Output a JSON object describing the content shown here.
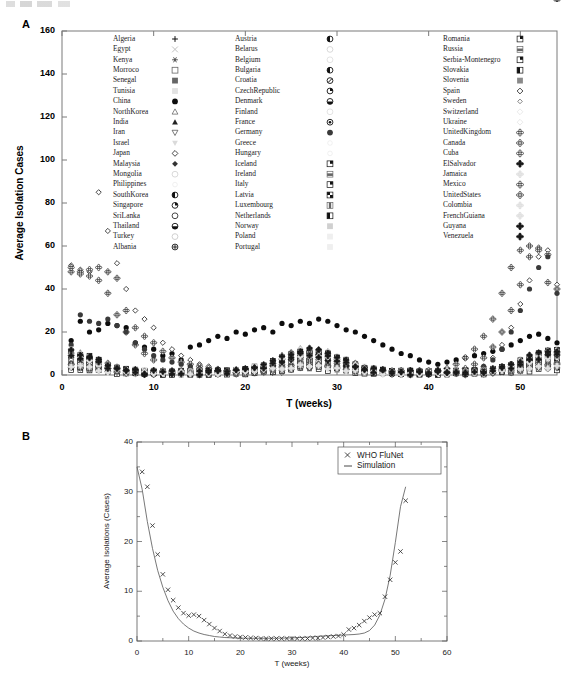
{
  "figure": {
    "panel_a_label": "A",
    "panel_b_label": "B"
  },
  "panel_a": {
    "ylabel": "Average Isolation Cases",
    "xlabel": "T (weeks)",
    "yticks": [
      "0",
      "20",
      "40",
      "60",
      "80",
      "100",
      "120",
      "140",
      "160"
    ],
    "xticks": [
      "0",
      "10",
      "20",
      "30",
      "40",
      "50"
    ],
    "ylim": [
      0,
      160
    ],
    "xlim": [
      0,
      54
    ],
    "legend_col1": [
      {
        "label": "Algeria",
        "marker": "plus"
      },
      {
        "label": "Egypt",
        "marker": "cross"
      },
      {
        "label": "Kenya",
        "marker": "asterisk"
      },
      {
        "label": "Morroco",
        "marker": "square-open"
      },
      {
        "label": "Senegal",
        "marker": "square-filled"
      },
      {
        "label": "Tunisia",
        "marker": "square-faint"
      },
      {
        "label": "China",
        "marker": "circle-filled"
      },
      {
        "label": "NorthKorea",
        "marker": "triangle-open"
      },
      {
        "label": "India",
        "marker": "triangle-filled"
      },
      {
        "label": "Iran",
        "marker": "invtriangle-open"
      },
      {
        "label": "Israel",
        "marker": "invtriangle-faint"
      },
      {
        "label": "Japan",
        "marker": "diamond-open"
      },
      {
        "label": "Malaysia",
        "marker": "diamond-filled"
      },
      {
        "label": "Mongolia",
        "marker": "circle-faint"
      },
      {
        "label": "Philippines",
        "marker": "dot-faint"
      },
      {
        "label": "SouthKorea",
        "marker": "circle-half-left"
      },
      {
        "label": "Singapore",
        "marker": "circle-quarter"
      },
      {
        "label": "SriLanka",
        "marker": "circle-open2"
      },
      {
        "label": "Thailand",
        "marker": "circle-half-bottom"
      },
      {
        "label": "Turkey",
        "marker": "circle-light"
      },
      {
        "label": "Albania",
        "marker": "circle-cross"
      }
    ],
    "legend_col2": [
      {
        "label": "Austria",
        "marker": "circle-half-left"
      },
      {
        "label": "Belarus",
        "marker": "circle-faint"
      },
      {
        "label": "Belgium",
        "marker": "circle-pale"
      },
      {
        "label": "Bulgaria",
        "marker": "circle-half-dark"
      },
      {
        "label": "Croatia",
        "marker": "circle-slash"
      },
      {
        "label": "CzechRepublic",
        "marker": "circle-quarter2"
      },
      {
        "label": "Denmark",
        "marker": "circle-half-bottom"
      },
      {
        "label": "Finland",
        "marker": "circle-pale2"
      },
      {
        "label": "France",
        "marker": "circle-bullseye"
      },
      {
        "label": "Germany",
        "marker": "circle-dark"
      },
      {
        "label": "Greece",
        "marker": "circle-ghost"
      },
      {
        "label": "Hungary",
        "marker": "circle-ghost2"
      },
      {
        "label": "Iceland",
        "marker": "square-quadrant"
      },
      {
        "label": "Ireland",
        "marker": "square-band"
      },
      {
        "label": "Italy",
        "marker": "square-corner"
      },
      {
        "label": "Latvia",
        "marker": "square-checker"
      },
      {
        "label": "Luxembourg",
        "marker": "square-vbar"
      },
      {
        "label": "Netherlands",
        "marker": "square-lcorner"
      },
      {
        "label": "Norway",
        "marker": "square-pale"
      },
      {
        "label": "Poland",
        "marker": "square-ghost"
      },
      {
        "label": "Portugal",
        "marker": "square-ghost2"
      }
    ],
    "legend_col3": [
      {
        "label": "Romania",
        "marker": "square-dark-corner"
      },
      {
        "label": "Russia",
        "marker": "square-hband"
      },
      {
        "label": "Serbia-Montenegro",
        "marker": "square-quad2"
      },
      {
        "label": "Slovakia",
        "marker": "square-lblock"
      },
      {
        "label": "Slovenia",
        "marker": "square-grey"
      },
      {
        "label": "Spain",
        "marker": "diamond-open2"
      },
      {
        "label": "Sweden",
        "marker": "diamond-small"
      },
      {
        "label": "Switzerland",
        "marker": "diamond-ghost"
      },
      {
        "label": "Ukraine",
        "marker": "diamond-ghost2"
      },
      {
        "label": "UnitedKingdom",
        "marker": "clover-dark"
      },
      {
        "label": "Canada",
        "marker": "clover-mid"
      },
      {
        "label": "Cuba",
        "marker": "clover-open"
      },
      {
        "label": "ElSalvador",
        "marker": "clover-filled"
      },
      {
        "label": "Jamaica",
        "marker": "clover-pale"
      },
      {
        "label": "Mexico",
        "marker": "clover-half"
      },
      {
        "label": "UnitedStates",
        "marker": "clover-cross"
      },
      {
        "label": "Colombia",
        "marker": "clover-ghost"
      },
      {
        "label": "FrenchGuiana",
        "marker": "clover-ghost2"
      },
      {
        "label": "Guyana",
        "marker": "clover-black"
      },
      {
        "label": "Venezuela",
        "marker": "clover-black2"
      }
    ]
  },
  "panel_b": {
    "ylabel": "Average Isolations (Cases)",
    "xlabel": "T (weeks)",
    "yticks": [
      "0",
      "10",
      "20",
      "30",
      "40"
    ],
    "xticks": [
      "0",
      "10",
      "20",
      "30",
      "40",
      "50",
      "60"
    ],
    "ylim": [
      0,
      40
    ],
    "xlim": [
      0,
      60
    ],
    "legend": [
      {
        "label": "WHO FluNet",
        "style": "marker-x"
      },
      {
        "label": "Simulation",
        "style": "line"
      }
    ]
  },
  "chart_data": [
    {
      "type": "scatter",
      "panel": "A",
      "title": "",
      "xlabel": "T (weeks)",
      "ylabel": "Average Isolation Cases",
      "xlim": [
        0,
        54
      ],
      "ylim": [
        0,
        160
      ],
      "grid": false,
      "legend_position": "inside-top",
      "note": "Weekly average influenza isolation cases per country; 62 country series plotted as distinct markers. Values are highest in weeks 1-10 and 45-54 (northern-hemisphere winter) and near zero in weeks 15-40.",
      "series": [
        {
          "name": "China",
          "marker": "circle-filled",
          "x": [
            1,
            2,
            3,
            4,
            5,
            6,
            7,
            8,
            9,
            10,
            11,
            12,
            13,
            14,
            15,
            16,
            17,
            18,
            19,
            20,
            21,
            22,
            23,
            24,
            25,
            26,
            27,
            28,
            29,
            30,
            31,
            32,
            33,
            34,
            35,
            36,
            37,
            38,
            39,
            40,
            41,
            42,
            43,
            44,
            45,
            46,
            47,
            48,
            49,
            50,
            51,
            52,
            53,
            54
          ],
          "y": [
            16,
            25,
            20,
            21,
            24,
            23,
            22,
            15,
            13,
            12,
            9,
            10,
            7,
            13,
            14,
            16,
            18,
            17,
            20,
            19,
            21,
            22,
            20,
            24,
            23,
            25,
            24,
            26,
            25,
            23,
            21,
            20,
            18,
            16,
            14,
            12,
            10,
            9,
            7,
            6,
            5,
            6,
            7,
            8,
            9,
            10,
            11,
            12,
            14,
            16,
            18,
            19,
            17,
            15
          ]
        },
        {
          "name": "Japan",
          "marker": "diamond-open",
          "x": [
            1,
            2,
            3,
            4,
            5,
            6,
            7,
            8,
            9,
            10,
            11,
            12,
            13,
            14,
            15,
            16,
            17,
            18,
            19,
            20,
            21,
            22,
            23,
            24,
            45,
            46,
            47,
            48,
            49,
            50,
            51,
            52,
            53,
            54
          ],
          "y": [
            51,
            49,
            48,
            85,
            67,
            52,
            40,
            30,
            26,
            22,
            15,
            12,
            9,
            7,
            5,
            4,
            3,
            2,
            2,
            1,
            1,
            1,
            1,
            1,
            2,
            4,
            8,
            14,
            22,
            33,
            44,
            55,
            58,
            42
          ]
        },
        {
          "name": "UnitedStates",
          "marker": "clover-cross",
          "x": [
            1,
            2,
            3,
            4,
            5,
            6,
            7,
            8,
            9,
            10,
            11,
            12,
            13,
            14,
            15,
            16,
            17,
            18,
            19,
            20,
            40,
            41,
            42,
            43,
            44,
            45,
            46,
            47,
            48,
            49,
            50,
            51,
            52,
            53,
            54
          ],
          "y": [
            48,
            48,
            49,
            50,
            48,
            45,
            30,
            22,
            18,
            15,
            11,
            8,
            6,
            5,
            4,
            3,
            2,
            2,
            1,
            1,
            1,
            2,
            3,
            5,
            8,
            12,
            18,
            26,
            38,
            50,
            58,
            60,
            59,
            43
          ]
        },
        {
          "name": "UnitedKingdom",
          "marker": "clover-dark",
          "x": [
            1,
            2,
            3,
            4,
            5,
            6,
            7,
            8,
            9,
            10,
            44,
            45,
            46,
            47,
            48,
            49,
            50,
            51,
            52,
            53,
            54
          ],
          "y": [
            50,
            47,
            46,
            44,
            38,
            28,
            20,
            14,
            10,
            7,
            3,
            5,
            8,
            13,
            20,
            30,
            42,
            55,
            58,
            56,
            40
          ]
        },
        {
          "name": "Germany",
          "marker": "circle-dark",
          "x": [
            1,
            2,
            3,
            4,
            5,
            6,
            7,
            8,
            9,
            10,
            11,
            12,
            13,
            14,
            15,
            46,
            47,
            48,
            49,
            50,
            51,
            52,
            53,
            54
          ],
          "y": [
            14,
            28,
            25,
            24,
            26,
            23,
            20,
            15,
            12,
            9,
            7,
            6,
            5,
            4,
            3,
            4,
            7,
            12,
            20,
            30,
            40,
            50,
            55,
            38
          ]
        }
      ]
    },
    {
      "type": "line",
      "panel": "B",
      "title": "",
      "xlabel": "T (weeks)",
      "ylabel": "Average Isolations (Cases)",
      "xlim": [
        0,
        60
      ],
      "ylim": [
        0,
        40
      ],
      "grid": false,
      "legend_position": "top-right",
      "series": [
        {
          "name": "WHO FluNet",
          "marker": "x",
          "style": "markers",
          "x": [
            1,
            2,
            3,
            4,
            5,
            6,
            7,
            8,
            9,
            10,
            11,
            12,
            13,
            14,
            15,
            16,
            17,
            18,
            19,
            20,
            21,
            22,
            23,
            24,
            25,
            26,
            27,
            28,
            29,
            30,
            31,
            32,
            33,
            34,
            35,
            36,
            37,
            38,
            39,
            40,
            41,
            42,
            43,
            44,
            45,
            46,
            47,
            48,
            49,
            50,
            51,
            52
          ],
          "y": [
            34.0,
            31.0,
            23.2,
            17.4,
            13.4,
            10.3,
            8.2,
            6.7,
            5.6,
            5.1,
            5.3,
            5.0,
            4.2,
            3.4,
            2.6,
            2.0,
            1.4,
            1.1,
            0.9,
            0.8,
            0.7,
            0.6,
            0.6,
            0.5,
            0.5,
            0.5,
            0.5,
            0.5,
            0.5,
            0.5,
            0.5,
            0.5,
            0.5,
            0.6,
            0.6,
            0.7,
            0.8,
            0.9,
            1.0,
            1.3,
            2.3,
            2.6,
            3.2,
            4.0,
            4.7,
            5.3,
            5.6,
            8.9,
            12.3,
            15.8,
            18.0,
            28.2
          ]
        },
        {
          "name": "Simulation",
          "marker": "none",
          "style": "line",
          "x": [
            0,
            1,
            2,
            3,
            4,
            5,
            6,
            7,
            8,
            9,
            10,
            11,
            12,
            13,
            14,
            15,
            16,
            17,
            18,
            19,
            20,
            21,
            22,
            23,
            24,
            25,
            26,
            27,
            28,
            29,
            30,
            31,
            32,
            33,
            34,
            35,
            36,
            37,
            38,
            39,
            40,
            41,
            42,
            43,
            44,
            45,
            46,
            47,
            48,
            49,
            50,
            51,
            52
          ],
          "y": [
            35.0,
            30.5,
            24.0,
            18.6,
            14.2,
            10.8,
            8.1,
            6.0,
            4.5,
            3.4,
            2.6,
            2.0,
            1.6,
            1.3,
            1.1,
            0.9,
            0.8,
            0.7,
            0.65,
            0.6,
            0.58,
            0.56,
            0.55,
            0.55,
            0.55,
            0.55,
            0.55,
            0.56,
            0.58,
            0.6,
            0.63,
            0.67,
            0.72,
            0.78,
            0.85,
            0.93,
            1.0,
            1.05,
            1.1,
            1.15,
            1.2,
            1.25,
            1.3,
            1.4,
            1.6,
            2.1,
            3.2,
            5.2,
            8.4,
            13.2,
            19.8,
            27.0,
            31.0
          ]
        }
      ]
    }
  ]
}
